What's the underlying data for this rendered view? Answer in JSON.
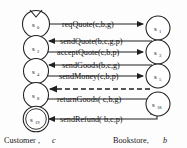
{
  "diagram": {
    "type": "state-transition-protocol",
    "title": "",
    "states": [
      {
        "id": "s0",
        "label": "s",
        "sub": "0",
        "x": 36,
        "y": 24,
        "r": 13.5,
        "accepting": false,
        "initial": true,
        "side": "left"
      },
      {
        "id": "s2",
        "label": "s",
        "sub": "2",
        "x": 36,
        "y": 48,
        "r": 12.5,
        "accepting": false,
        "initial": false,
        "side": "left"
      },
      {
        "id": "s4",
        "label": "s",
        "sub": "4",
        "x": 36,
        "y": 71,
        "r": 12.5,
        "accepting": false,
        "initial": false,
        "side": "left"
      },
      {
        "id": "s8",
        "label": "s",
        "sub": "8",
        "x": 36,
        "y": 95,
        "r": 12.5,
        "accepting": false,
        "initial": false,
        "side": "left"
      },
      {
        "id": "s19",
        "label": "s",
        "sub": "19",
        "x": 36,
        "y": 119,
        "r": 12.5,
        "accepting": true,
        "initial": false,
        "side": "left"
      },
      {
        "id": "s1",
        "label": "s",
        "sub": "1",
        "x": 158,
        "y": 28,
        "r": 12.0,
        "accepting": false,
        "initial": false,
        "side": "right"
      },
      {
        "id": "s3",
        "label": "s",
        "sub": "3",
        "x": 158,
        "y": 52,
        "r": 12.0,
        "accepting": false,
        "initial": false,
        "side": "right"
      },
      {
        "id": "s5",
        "label": "s",
        "sub": "5",
        "x": 158,
        "y": 76,
        "r": 12.0,
        "accepting": false,
        "initial": false,
        "side": "right"
      },
      {
        "id": "s18",
        "label": "s",
        "sub": "18",
        "x": 158,
        "y": 104,
        "r": 12.0,
        "accepting": false,
        "initial": false,
        "side": "right"
      }
    ],
    "transitions": [
      {
        "id": "t1",
        "label": "reqQuote(c,b,g)",
        "from": "s0",
        "to": "s1",
        "direction": "right",
        "style": "solid",
        "y": 24,
        "label_x": 62,
        "label_y": 27
      },
      {
        "id": "t2",
        "label": "sendQuote(b,c,g,p)",
        "from": "s1",
        "to": "s2",
        "direction": "left",
        "style": "solid",
        "y": 41,
        "label_x": 60,
        "label_y": 44
      },
      {
        "id": "t3",
        "label": "acceptQuote(c,b,p)",
        "from": "s2",
        "to": "s3",
        "direction": "right",
        "style": "solid",
        "y": 52,
        "label_x": 57,
        "label_y": 55
      },
      {
        "id": "t4",
        "label": "sendGoods(b,c,g)",
        "from": "s3",
        "to": "s4",
        "direction": "left",
        "style": "solid",
        "y": 65,
        "label_x": 62,
        "label_y": 68
      },
      {
        "id": "t5",
        "label": "sendMoney(c,b,p)",
        "from": "s4",
        "to": "s5",
        "direction": "right",
        "style": "solid",
        "y": 76,
        "label_x": 59,
        "label_y": 79
      },
      {
        "id": "t6",
        "label": "",
        "from": "s5",
        "to": "s8",
        "direction": "left",
        "style": "dashed",
        "y": 89,
        "label_x": 0,
        "label_y": 0
      },
      {
        "id": "t7",
        "label": "returnGoods( c,b,g)",
        "from": "s8",
        "to": "s18",
        "direction": "right",
        "style": "solid",
        "y": 99,
        "label_x": 57,
        "label_y": 102
      },
      {
        "id": "t8",
        "label": "sendRefund( b,c,p)",
        "from": "s18",
        "to": "s19",
        "direction": "left",
        "style": "solid",
        "y": 119,
        "label_x": 60,
        "label_y": 122
      }
    ],
    "roles": [
      {
        "id": "customer",
        "name": "Customer ,",
        "var": "c",
        "x": 4,
        "y": 143
      },
      {
        "id": "bookstore",
        "name": "Bookstore,",
        "var": "b",
        "x": 113,
        "y": 143
      }
    ],
    "colors": {
      "stroke": "#1f1f1f",
      "text": "#141414",
      "background": "#fdfdfd"
    }
  }
}
